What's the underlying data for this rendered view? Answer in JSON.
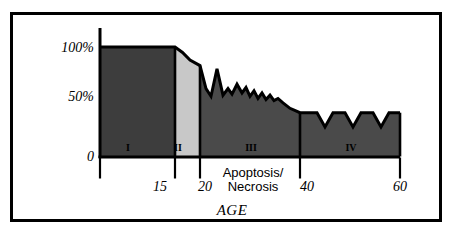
{
  "figure": {
    "background_color": "#ffffff",
    "frame_color": "#000000"
  },
  "chart_data": {
    "type": "area",
    "title": "",
    "subtitle": "",
    "xlabel": "AGE",
    "ylabel": "",
    "xlim": [
      0,
      65
    ],
    "ylim": [
      0,
      110
    ],
    "grid": false,
    "legend": "none",
    "y_ticks": [
      {
        "value": 100,
        "label": "100%"
      },
      {
        "value": 50,
        "label": "50%"
      },
      {
        "value": 0,
        "label": "0"
      }
    ],
    "x_ticks": [
      {
        "value": 0,
        "label": ""
      },
      {
        "value": 15,
        "label": "15"
      },
      {
        "value": 20,
        "label": "20"
      },
      {
        "value": 40,
        "label": "40"
      },
      {
        "value": 60,
        "label": "60"
      }
    ],
    "annotations": [
      {
        "text_line_1": "Apoptosis/",
        "text_line_2": "Necrosis",
        "x": 30,
        "y": -18
      }
    ],
    "regions": [
      {
        "label": "I",
        "name": "region-i",
        "color": "#3d3d3d",
        "x_start": 0,
        "x_end": 15,
        "description": "Flat plateau at 100%",
        "points": [
          [
            0,
            100
          ],
          [
            15,
            100
          ]
        ]
      },
      {
        "label": "II",
        "name": "region-ii",
        "color": "#c8c8c8",
        "x_start": 15,
        "x_end": 20,
        "description": "Smooth gentle decline from 100% to 83%",
        "points": [
          [
            15,
            100
          ],
          [
            16.5,
            95
          ],
          [
            18,
            88
          ],
          [
            20,
            83
          ]
        ]
      },
      {
        "label": "III",
        "name": "region-iii",
        "color": "#4a4a4a",
        "x_start": 20,
        "x_end": 40,
        "description": "Jagged oscillating decline from 83% to 40%",
        "points": [
          [
            20,
            83
          ],
          [
            21.2,
            62
          ],
          [
            22.2,
            55
          ],
          [
            23.4,
            80
          ],
          [
            24.6,
            56
          ],
          [
            25.6,
            62
          ],
          [
            26.4,
            57
          ],
          [
            27.4,
            66
          ],
          [
            28.4,
            58
          ],
          [
            29.2,
            63
          ],
          [
            30.0,
            55
          ],
          [
            30.8,
            60
          ],
          [
            31.6,
            53
          ],
          [
            32.4,
            58
          ],
          [
            33.2,
            52
          ],
          [
            34.0,
            56
          ],
          [
            34.8,
            51
          ],
          [
            35.6,
            53
          ],
          [
            36.6,
            49
          ],
          [
            38.0,
            44
          ],
          [
            40,
            40
          ]
        ]
      },
      {
        "label": "IV",
        "name": "region-iv",
        "color": "#4a4a4a",
        "x_start": 40,
        "x_end": 60,
        "description": "Sawtooth plateau around 40% with three V notches",
        "points": [
          [
            40,
            40
          ],
          [
            43.4,
            40
          ],
          [
            45.0,
            27
          ],
          [
            46.6,
            40
          ],
          [
            49.0,
            40
          ],
          [
            50.6,
            27
          ],
          [
            52.2,
            40
          ],
          [
            54.6,
            40
          ],
          [
            56.2,
            27
          ],
          [
            57.8,
            40
          ],
          [
            60,
            40
          ]
        ]
      }
    ]
  }
}
